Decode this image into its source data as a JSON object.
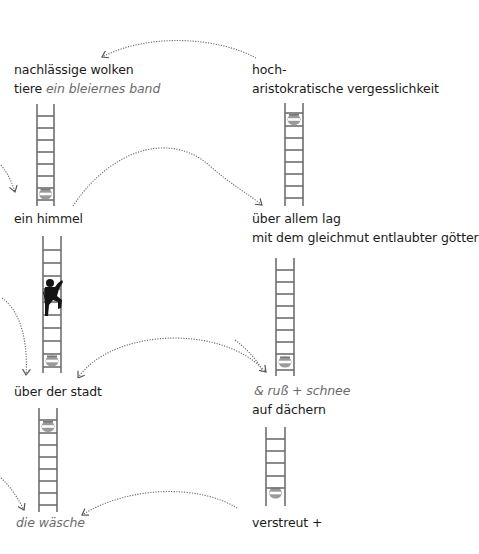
{
  "poem": {
    "left_column": [
      {
        "id": "stanza-1",
        "lines": [
          {
            "text": "nachlässige wolken",
            "italic": false
          },
          {
            "text": "tiere",
            "italic": false,
            "suffix": "ein bleiernes band",
            "suffix_italic": true
          }
        ]
      },
      {
        "id": "stanza-2",
        "lines": [
          {
            "text": "ein himmel",
            "italic": false
          }
        ]
      },
      {
        "id": "stanza-3",
        "lines": [
          {
            "text": "über der stadt",
            "italic": false
          }
        ]
      },
      {
        "id": "stanza-4",
        "lines": [
          {
            "text": "die wäsche",
            "italic": true
          }
        ]
      }
    ],
    "right_column": [
      {
        "id": "stanza-1",
        "lines": [
          {
            "text": "hoch-",
            "italic": false
          },
          {
            "text": "aristokratische vergesslichkeit",
            "italic": false
          }
        ]
      },
      {
        "id": "stanza-2",
        "lines": [
          {
            "text": "über allem lag",
            "italic": false
          },
          {
            "text": "mit dem gleichmut entlaubter götter",
            "italic": false
          }
        ]
      },
      {
        "id": "stanza-3",
        "lines": [
          {
            "text": "& ruß + schnee",
            "italic": true
          },
          {
            "text": "auf dächern",
            "italic": false
          }
        ]
      },
      {
        "id": "stanza-4",
        "lines": [
          {
            "text": "verstreut +",
            "italic": false
          }
        ]
      }
    ]
  },
  "text": {
    "l1a": "nachlässige wolken",
    "l1b": "tiere",
    "l1c": "ein bleiernes band",
    "l2": "ein himmel",
    "l3": "über der stadt",
    "l4": "die wäsche",
    "r1a": "hoch-",
    "r1b": "aristokratische vergesslichkeit",
    "r2a": "über allem lag",
    "r2b": "mit dem gleichmut entlaubter götter",
    "r3a": "& ruß + schnee",
    "r3b": "auf dächern",
    "r4": "verstreut +"
  },
  "ladders": [
    {
      "id": "ladder-left-1",
      "rungs": 8,
      "pot_position": "bottom",
      "climber": false
    },
    {
      "id": "ladder-right-1",
      "rungs": 8,
      "pot_position": "top",
      "climber": false
    },
    {
      "id": "ladder-left-2",
      "rungs": 9,
      "pot_position": "bottom",
      "climber": true
    },
    {
      "id": "ladder-right-2",
      "rungs": 8,
      "pot_position": "bottom",
      "climber": false
    },
    {
      "id": "ladder-left-3",
      "rungs": 8,
      "pot_position": "top",
      "climber": false
    },
    {
      "id": "ladder-right-3",
      "rungs": 5,
      "pot_position": "bottom",
      "climber": false
    }
  ],
  "icons": {
    "pot": "pot-icon",
    "climber": "climbing-figure-icon",
    "arrow": "dotted-arrow-icon"
  },
  "colors": {
    "text": "#1a1a1a",
    "italic_text": "#6b6b6b",
    "ladder": "#6f6f6f",
    "arrow": "#6a6a6a",
    "pot": "#8a8a8a",
    "climber": "#141414",
    "background": "#ffffff"
  }
}
